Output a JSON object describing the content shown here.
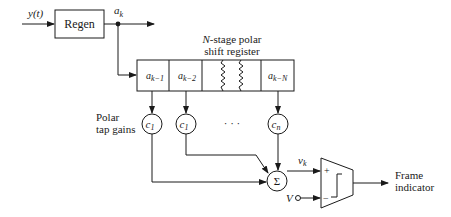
{
  "diagram": {
    "input_label": "y(t)",
    "regen_label": "Regen",
    "ak_label": {
      "base": "a",
      "sub": "k"
    },
    "register_title_line1_italic": "N",
    "register_title_line1_rest": "-stage polar",
    "register_title_line2": "shift register",
    "register_cells": [
      {
        "base": "a",
        "sub": "k−1"
      },
      {
        "base": "a",
        "sub": "k−2"
      },
      {
        "base": "a",
        "sub": "k−N"
      }
    ],
    "tap_gains_label_line1": "Polar",
    "tap_gains_label_line2": "tap gains",
    "tap_gains": [
      {
        "base": "c",
        "sub": "1"
      },
      {
        "base": "c",
        "sub": "1"
      },
      {
        "base": "c",
        "sub": "n"
      }
    ],
    "ellipsis": "· · ·",
    "summer_symbol": "Σ",
    "vk_label": {
      "base": "v",
      "sub": "k"
    },
    "threshold_label": "V",
    "comparator_plus": "+",
    "comparator_minus": "−",
    "output_label_line1": "Frame",
    "output_label_line2": "indicator"
  }
}
